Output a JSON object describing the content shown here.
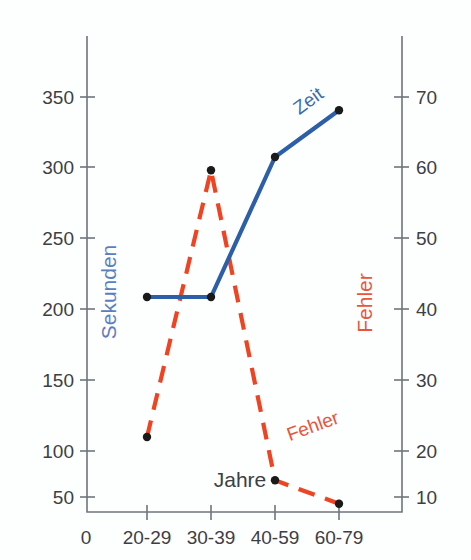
{
  "chart_data": {
    "type": "line",
    "title": "",
    "subtitle": "",
    "xlabel": "Jahre",
    "categories": [
      "20-29",
      "30-39",
      "40-59",
      "60-79"
    ],
    "x_origin_label": "0",
    "grid": false,
    "legend_position": "inline-annotations",
    "axes": {
      "left": {
        "label": "Sekunden",
        "color": "#5b7fbe",
        "ticks": [
          50,
          100,
          150,
          200,
          250,
          300,
          350
        ],
        "tick_labels": [
          "50",
          "100",
          "150",
          "200",
          "250",
          "300",
          "350"
        ],
        "ylim": [
          0,
          395
        ]
      },
      "right": {
        "label": "Fehler",
        "color": "#e8553c",
        "ticks": [
          10,
          20,
          30,
          40,
          50,
          60,
          70
        ],
        "tick_labels": [
          "10",
          "20",
          "30",
          "40",
          "50",
          "60",
          "70"
        ],
        "ylim": [
          0,
          79
        ]
      }
    },
    "series": [
      {
        "name": "Zeit",
        "inline_label": "Zeit",
        "axis": "left",
        "unit": "Sekunden",
        "color": "#2d5fa8",
        "style": "solid",
        "marker": "dot",
        "values": [
          200,
          200,
          305,
          340
        ]
      },
      {
        "name": "Fehler",
        "inline_label": "Fehler",
        "axis": "right",
        "unit": "Fehler",
        "color": "#ef4422",
        "style": "dashed",
        "marker": "dot",
        "values": [
          19,
          59,
          12.5,
          9
        ]
      }
    ]
  }
}
